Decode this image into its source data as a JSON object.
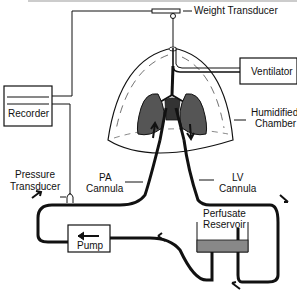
{
  "diagram": {
    "type": "isolated perfused lung apparatus schematic",
    "labels": {
      "weight_transducer": "Weight Transducer",
      "ventilator": "Ventilator",
      "recorder": "Recorder",
      "humidified_chamber_1": "Humidified",
      "humidified_chamber_2": "Chamber",
      "pressure_transducer_1": "Pressure",
      "pressure_transducer_2": "Transducer",
      "pa_cannula_1": "PA",
      "pa_cannula_2": "Cannula",
      "lv_cannula_1": "LV",
      "lv_cannula_2": "Cannula",
      "perfusate_reservoir_1": "Perfusate",
      "perfusate_reservoir_2": "Reservoir",
      "pump": "Pump"
    },
    "colors": {
      "ink": "#111111",
      "paper": "#ffffff",
      "frame": "#bbbbbb",
      "lung_fill": "#555555"
    }
  }
}
